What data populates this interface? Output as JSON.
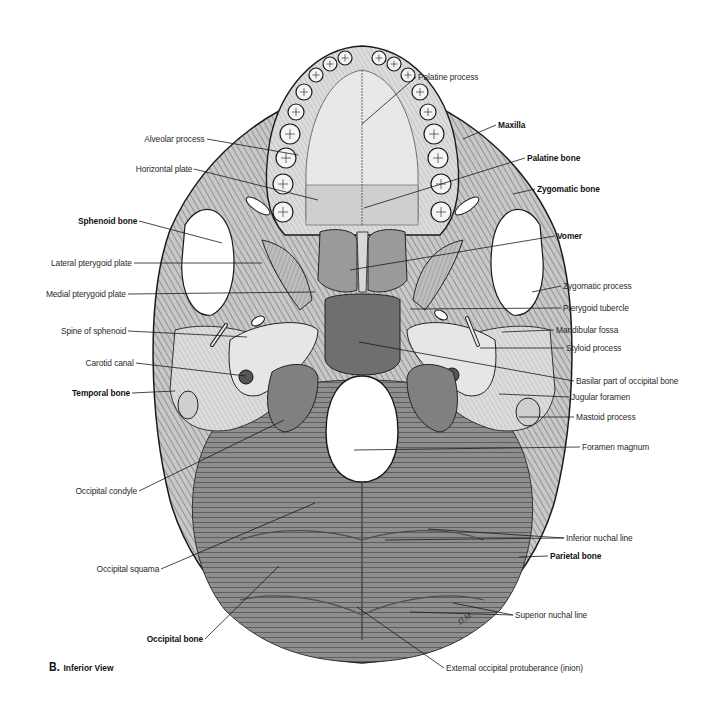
{
  "figure": {
    "panel_letter": "B.",
    "caption": "Inferior View",
    "artist_signature": "D.M."
  },
  "labels_left": [
    {
      "id": "alveolar-process",
      "text": "Alveolar process",
      "bold": false
    },
    {
      "id": "horizontal-plate",
      "text": "Horizontal plate",
      "bold": false
    },
    {
      "id": "sphenoid-bone",
      "text": "Sphenoid bone",
      "bold": true
    },
    {
      "id": "lateral-pterygoid-plate",
      "text": "Lateral pterygoid plate",
      "bold": false
    },
    {
      "id": "medial-pterygoid-plate",
      "text": "Medial pterygoid plate",
      "bold": false
    },
    {
      "id": "spine-of-sphenoid",
      "text": "Spine of sphenoid",
      "bold": false
    },
    {
      "id": "carotid-canal",
      "text": "Carotid canal",
      "bold": false
    },
    {
      "id": "temporal-bone",
      "text": "Temporal bone",
      "bold": true
    },
    {
      "id": "occipital-condyle",
      "text": "Occipital condyle",
      "bold": false
    },
    {
      "id": "occipital-squama",
      "text": "Occipital squama",
      "bold": false
    },
    {
      "id": "occipital-bone",
      "text": "Occipital bone",
      "bold": true
    }
  ],
  "labels_right": [
    {
      "id": "palatine-process",
      "text": "Palatine process",
      "bold": false
    },
    {
      "id": "maxilla",
      "text": "Maxilla",
      "bold": true
    },
    {
      "id": "palatine-bone",
      "text": "Palatine bone",
      "bold": true
    },
    {
      "id": "zygomatic-bone",
      "text": "Zygomatic bone",
      "bold": true
    },
    {
      "id": "vomer",
      "text": "Vomer",
      "bold": true
    },
    {
      "id": "zygomatic-process",
      "text": "Zygomatic process",
      "bold": false
    },
    {
      "id": "pterygoid-tubercle",
      "text": "Pterygoid tubercle",
      "bold": false
    },
    {
      "id": "mandibular-fossa",
      "text": "Mandibular fossa",
      "bold": false
    },
    {
      "id": "styloid-process",
      "text": "Styloid process",
      "bold": false
    },
    {
      "id": "basilar-part",
      "text": "Basilar part of occipital bone",
      "bold": false
    },
    {
      "id": "jugular-foramen",
      "text": "Jugular foramen",
      "bold": false
    },
    {
      "id": "mastoid-process",
      "text": "Mastoid process",
      "bold": false
    },
    {
      "id": "foramen-magnum",
      "text": "Foramen magnum",
      "bold": false
    },
    {
      "id": "inferior-nuchal-line",
      "text": "Inferior nuchal line",
      "bold": false
    },
    {
      "id": "parietal-bone",
      "text": "Parietal bone",
      "bold": true
    },
    {
      "id": "superior-nuchal-line",
      "text": "Superior nuchal line",
      "bold": false
    },
    {
      "id": "external-occipital-protuberance",
      "text": "External occipital protuberance (inion)",
      "bold": false
    }
  ],
  "colors": {
    "bone_light": "#e4e4e4",
    "bone_mid": "#b8b8b8",
    "bone_dark": "#7a7a7a",
    "outline": "#1a1a1a",
    "leader": "#1a1a1a",
    "label_text": "#2a2a2a"
  }
}
